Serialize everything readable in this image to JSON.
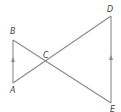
{
  "diagram": {
    "type": "geometry",
    "points": {
      "A": {
        "label": "A",
        "x": 13,
        "y": 83
      },
      "B": {
        "label": "B",
        "x": 13,
        "y": 40
      },
      "C": {
        "label": "C",
        "x": 45,
        "y": 61
      },
      "D": {
        "label": "D",
        "x": 111,
        "y": 16
      },
      "E": {
        "label": "E",
        "x": 111,
        "y": 103
      }
    },
    "segments": [
      {
        "from": "A",
        "to": "B",
        "parallel_mark": true
      },
      {
        "from": "B",
        "to": "E",
        "parallel_mark": false
      },
      {
        "from": "A",
        "to": "D",
        "parallel_mark": false
      },
      {
        "from": "D",
        "to": "E",
        "parallel_mark": true
      }
    ],
    "labels": {
      "A": "A",
      "B": "B",
      "C": "C",
      "D": "D",
      "E": "E"
    },
    "colors": {
      "line": "#8a8a8a",
      "text": "#444444"
    }
  }
}
